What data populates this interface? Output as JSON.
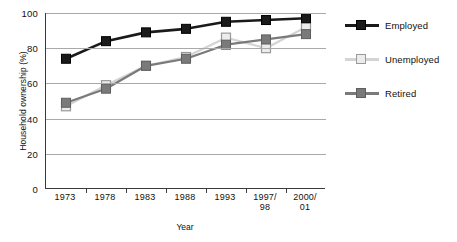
{
  "chart_data": {
    "type": "line",
    "title": "",
    "xlabel": "Year",
    "ylabel": "Household ownership (%)",
    "categories": [
      "1973",
      "1978",
      "1983",
      "1988",
      "1993",
      "1997/\n98",
      "2000/\n01"
    ],
    "category_lines": [
      [
        "1973"
      ],
      [
        "1978"
      ],
      [
        "1983"
      ],
      [
        "1988"
      ],
      [
        "1993"
      ],
      [
        "1997/",
        "98"
      ],
      [
        "2000/",
        "01"
      ]
    ],
    "ylim": [
      0,
      100
    ],
    "yticks": [
      0,
      20,
      40,
      60,
      80,
      100
    ],
    "ytick_labels": [
      "0",
      "20",
      "40",
      "60",
      "80",
      "100"
    ],
    "grid": true,
    "grid_axis": "y",
    "legend_position": "right",
    "series": [
      {
        "name": "Employed",
        "color": "#1a1a1a",
        "marker": "filled-square",
        "values": [
          74,
          84,
          89,
          91,
          95,
          96,
          97
        ]
      },
      {
        "name": "Unemployed",
        "color": "#d4d4d4",
        "marker": "open-square",
        "values": [
          47,
          59,
          70,
          75,
          86,
          80,
          92
        ]
      },
      {
        "name": "Retired",
        "color": "#7a7a7a",
        "marker": "filled-square",
        "values": [
          49,
          57,
          70,
          74,
          82,
          85,
          88
        ]
      }
    ]
  },
  "axis": {
    "y_title": "Household ownership (%)",
    "x_title": "Year"
  },
  "legend": {
    "items": [
      {
        "label": "Employed"
      },
      {
        "label": "Unemployed"
      },
      {
        "label": "Retired"
      }
    ]
  }
}
